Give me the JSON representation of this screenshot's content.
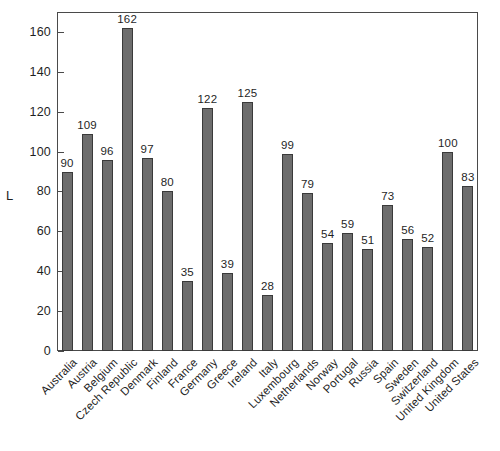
{
  "chart_data": {
    "type": "bar",
    "title": "",
    "xlabel": "",
    "ylabel": "L",
    "ylim": [
      0,
      170
    ],
    "yticks": [
      0,
      20,
      40,
      60,
      80,
      100,
      120,
      140,
      160
    ],
    "grid": false,
    "legend": null,
    "bar_color": "#6d6d6d",
    "bar_edge_color": "#3a3a3a",
    "frame_color": "#4a4a4a",
    "background_color": "#ffffff",
    "value_labels_shown": true,
    "categories": [
      "Australia",
      "Austria",
      "Belgium",
      "Czech Republic",
      "Denmark",
      "Finland",
      "France",
      "Germany",
      "Greece",
      "Ireland",
      "Italy",
      "Luxembourg",
      "Netherlands",
      "Norway",
      "Portugal",
      "Russia",
      "Spain",
      "Sweden",
      "Switzerland",
      "United Kingdom",
      "United States"
    ],
    "values": [
      90,
      109,
      96,
      162,
      97,
      80,
      35,
      122,
      39,
      125,
      28,
      99,
      79,
      54,
      59,
      51,
      73,
      56,
      52,
      100,
      83
    ]
  }
}
